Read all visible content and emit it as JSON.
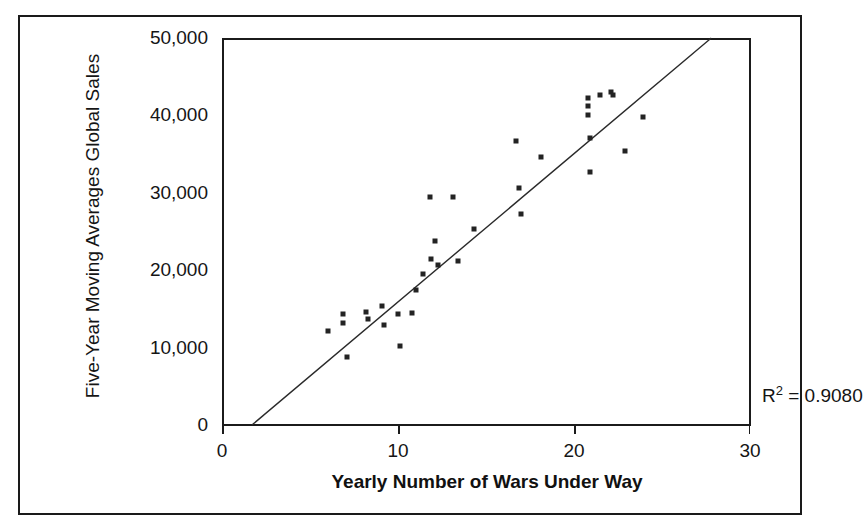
{
  "chart_data": {
    "type": "scatter",
    "title": "",
    "xlabel": "Yearly Number of Wars Under Way",
    "ylabel": "Five-Year Moving Averages Global Sales",
    "xlim": [
      0,
      30
    ],
    "ylim": [
      0,
      50000
    ],
    "xticks": [
      0,
      10,
      20,
      30
    ],
    "xtick_labels": [
      "0",
      "10",
      "20",
      "30"
    ],
    "yticks": [
      0,
      10000,
      20000,
      30000,
      40000,
      50000
    ],
    "ytick_labels": [
      "0",
      "10,000",
      "20,000",
      "30,000",
      "40,000",
      "50,000"
    ],
    "grid": false,
    "legend": null,
    "annotations": [
      {
        "name": "r-squared",
        "text_prefix": "R",
        "text_exponent": "2",
        "text_suffix": " = 0.9080",
        "value": 0.908,
        "x": 25.0,
        "y": 8000
      }
    ],
    "marker": {
      "shape": "square",
      "size": 5,
      "color": "#232323"
    },
    "trendline": {
      "type": "linear",
      "color": "#2a2a2a",
      "width": 1.4,
      "x_start": 1.7,
      "y_start": 0,
      "x_end": 27.8,
      "y_end": 50000
    },
    "points": [
      {
        "x": 6.0,
        "y": 12200
      },
      {
        "x": 6.9,
        "y": 14300
      },
      {
        "x": 6.9,
        "y": 13200
      },
      {
        "x": 7.1,
        "y": 8800
      },
      {
        "x": 8.2,
        "y": 14600
      },
      {
        "x": 8.3,
        "y": 13700
      },
      {
        "x": 9.1,
        "y": 15400
      },
      {
        "x": 9.2,
        "y": 12900
      },
      {
        "x": 10.0,
        "y": 14400
      },
      {
        "x": 10.1,
        "y": 10200
      },
      {
        "x": 10.8,
        "y": 14500
      },
      {
        "x": 11.0,
        "y": 17500
      },
      {
        "x": 11.4,
        "y": 19500
      },
      {
        "x": 11.8,
        "y": 29400
      },
      {
        "x": 11.9,
        "y": 21400
      },
      {
        "x": 12.1,
        "y": 23800
      },
      {
        "x": 12.3,
        "y": 20700
      },
      {
        "x": 13.1,
        "y": 29400
      },
      {
        "x": 13.4,
        "y": 21200
      },
      {
        "x": 14.3,
        "y": 25300
      },
      {
        "x": 16.7,
        "y": 36700
      },
      {
        "x": 16.9,
        "y": 30600
      },
      {
        "x": 17.0,
        "y": 27200
      },
      {
        "x": 18.1,
        "y": 34600
      },
      {
        "x": 20.8,
        "y": 42200
      },
      {
        "x": 20.8,
        "y": 41200
      },
      {
        "x": 20.8,
        "y": 40000
      },
      {
        "x": 20.9,
        "y": 37100
      },
      {
        "x": 20.9,
        "y": 32700
      },
      {
        "x": 21.5,
        "y": 42600
      },
      {
        "x": 22.1,
        "y": 43000
      },
      {
        "x": 22.2,
        "y": 42700
      },
      {
        "x": 22.9,
        "y": 35400
      },
      {
        "x": 23.9,
        "y": 39800
      }
    ]
  }
}
